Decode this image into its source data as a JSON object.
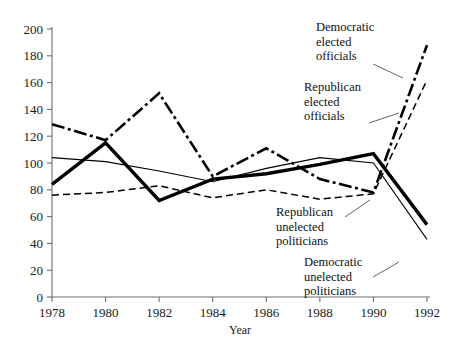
{
  "chart_data": {
    "type": "line",
    "title": "",
    "xlabel": "Year",
    "ylabel": "",
    "categories": [
      1978,
      1980,
      1982,
      1984,
      1986,
      1988,
      1990,
      1992
    ],
    "x": [
      1978,
      1980,
      1982,
      1984,
      1986,
      1988,
      1990,
      1992
    ],
    "xlim": [
      1978,
      1992
    ],
    "ylim": [
      0,
      200
    ],
    "ytick_labels": [
      "0",
      "20",
      "40",
      "60",
      "80",
      "100",
      "120",
      "140",
      "160",
      "180",
      "200"
    ],
    "yticks": [
      0,
      20,
      40,
      60,
      80,
      100,
      120,
      140,
      160,
      180,
      200
    ],
    "xtick_labels": [
      "1978",
      "1980",
      "1982",
      "1984",
      "1986",
      "1988",
      "1990",
      "1992"
    ],
    "grid": false,
    "legend_position": "inline-annotations",
    "series": [
      {
        "name": "Democratic elected officials",
        "style": "dash-dot-thick",
        "values": [
          129,
          117,
          152,
          90,
          111,
          88,
          78,
          188
        ]
      },
      {
        "name": "Republican elected officials",
        "style": "dashed-thin",
        "values": [
          76,
          78,
          83,
          74,
          80,
          73,
          77,
          162
        ]
      },
      {
        "name": "Republican unelected politicians",
        "style": "solid-thick",
        "values": [
          84,
          115,
          72,
          88,
          92,
          99,
          107,
          54
        ]
      },
      {
        "name": "Democratic unelected politicians",
        "style": "solid-thin",
        "values": [
          104,
          101,
          94,
          86,
          96,
          104,
          100,
          43
        ]
      }
    ],
    "annotations": [
      "Democratic\nelected\nofficials",
      "Republican\nelected\nofficials",
      "Republican\nunelected\npoliticians",
      "Democratic\nunelected\npoliticians"
    ]
  },
  "labels": {
    "dem_elected": "Democratic\nelected\nofficials",
    "rep_elected": "Republican\nelected\nofficials",
    "rep_unelected": "Republican\nunelected\npoliticians",
    "dem_unelected": "Democratic\nunelected\npoliticians",
    "x_axis_title": "Year"
  },
  "colors": {
    "axis": "#6e6e6e",
    "line": "#000000",
    "background": "#ffffff"
  }
}
